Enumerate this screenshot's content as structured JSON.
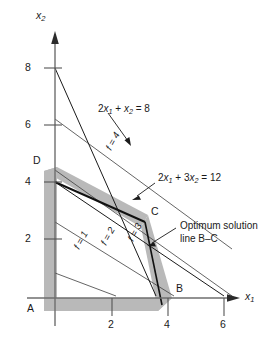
{
  "figure": {
    "background_color": "#ffffff",
    "line_color": "#1a1a1a",
    "shade_color": "#b3b3b3"
  },
  "axes": {
    "x_axis_label": "x",
    "x_axis_sub": "1",
    "y_axis_label": "x",
    "y_axis_sub": "2",
    "x_ticks": [
      "2",
      "4",
      "6"
    ],
    "x_tick_values": [
      2,
      4,
      6
    ],
    "y_ticks": [
      "8",
      "6",
      "4",
      "2"
    ],
    "y_tick_values": [
      8,
      6,
      4,
      2
    ],
    "xlim": [
      0,
      6.8
    ],
    "ylim": [
      0,
      8.8
    ]
  },
  "vertices": [
    {
      "id": "A",
      "label": "A",
      "x": 0,
      "y": 0
    },
    {
      "id": "B",
      "label": "B",
      "x": 4,
      "y": 0
    },
    {
      "id": "C",
      "label": "C",
      "x": 3,
      "y": 2
    },
    {
      "id": "D",
      "label": "D",
      "x": 0,
      "y": 4
    }
  ],
  "constraints": [
    {
      "id": "c1",
      "label_parts": [
        "2",
        "x",
        "1",
        " + ",
        "x",
        "2",
        " = 8"
      ],
      "label_text": "2x1 + x2 = 8",
      "coef_x1": 2,
      "coef_x2": 1,
      "rhs": 8,
      "from": [
        0,
        8
      ],
      "to": [
        4,
        0
      ]
    },
    {
      "id": "c2",
      "label_parts": [
        "2",
        "x",
        "1",
        " + 3",
        "x",
        "2",
        " = 12"
      ],
      "label_text": "2x1 + 3x2 = 12",
      "coef_x1": 2,
      "coef_x2": 3,
      "rhs": 12,
      "from": [
        0,
        4
      ],
      "to": [
        6,
        0
      ]
    }
  ],
  "objective_lines": [
    {
      "label": "f = 1",
      "value": 1,
      "from": [
        0,
        0.9
      ],
      "to": [
        1.8,
        0
      ]
    },
    {
      "label": "f = 2",
      "value": 2,
      "from": [
        0,
        2.7
      ],
      "to": [
        3.5,
        0
      ]
    },
    {
      "label": "f = 3",
      "value": 3,
      "from": [
        0,
        4.5
      ],
      "to": [
        5.2,
        0
      ]
    },
    {
      "label": "f = 4",
      "value": 4,
      "from": [
        0,
        6.2
      ],
      "to": [
        6.9,
        0
      ]
    }
  ],
  "annotations": {
    "optimum_line1": "Optimum solution",
    "optimum_line2": "line B–C"
  }
}
